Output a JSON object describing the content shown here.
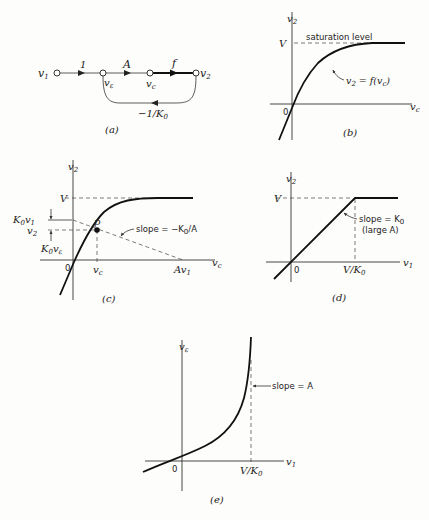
{
  "panels": {
    "a": {
      "caption": "(a)",
      "nodes": [
        {
          "name": "v",
          "sub": "1"
        },
        {
          "name": "v",
          "sub": "ε"
        },
        {
          "name": "v",
          "sub": "c"
        },
        {
          "name": "v",
          "sub": "2"
        }
      ],
      "branches": [
        {
          "from": "v1",
          "to": "vε",
          "gain": "1"
        },
        {
          "from": "vε",
          "to": "vc",
          "gain": "A"
        },
        {
          "from": "vc",
          "to": "v2",
          "gain": "f"
        },
        {
          "from": "v2",
          "to": "vε",
          "gain_main": "−1/K",
          "gain_sub": "0"
        }
      ]
    },
    "b": {
      "caption": "(b)",
      "y_axis": {
        "name": "v",
        "sub": "2"
      },
      "x_axis": {
        "name": "v",
        "sub": "c"
      },
      "origin": "0",
      "level_label": "V",
      "saturation_label": "saturation level",
      "curve_label": "v₂ = f(v꜀)",
      "curve_label_parts": {
        "pre": "v",
        "sub1": "2",
        "mid": " = f(v",
        "sub2": "c",
        "post": ")"
      }
    },
    "c": {
      "caption": "(c)",
      "y_axis": {
        "name": "v",
        "sub": "2"
      },
      "x_axis": {
        "name": "v",
        "sub": "c"
      },
      "origin": "0",
      "level_label": "V",
      "point_label": "p",
      "k0v1_label": {
        "k": "K",
        "k_sub": "0",
        "v": "v",
        "v_sub": "1"
      },
      "v2_label": {
        "name": "v",
        "sub": "2"
      },
      "k0ve_label": {
        "k": "K",
        "k_sub": "0",
        "v": "v",
        "v_sub": "ε"
      },
      "vc_tick": {
        "name": "v",
        "sub": "c"
      },
      "av1_tick": {
        "a": "A",
        "v": "v",
        "sub": "1"
      },
      "slope_label": {
        "pre": "slope = −K",
        "sub": "0",
        "post": "/A"
      }
    },
    "d": {
      "caption": "(d)",
      "y_axis": {
        "name": "v",
        "sub": "2"
      },
      "x_axis": {
        "name": "v",
        "sub": "1"
      },
      "origin": "0",
      "level_label": "V",
      "knee_tick": {
        "pre": "V/K",
        "sub": "0"
      },
      "slope_label": {
        "pre": "slope = K",
        "sub": "0"
      },
      "slope_note": "(large A)"
    },
    "e": {
      "caption": "(e)",
      "y_axis": {
        "name": "v",
        "sub": "ε"
      },
      "x_axis": {
        "name": "v",
        "sub": "1"
      },
      "origin": "0",
      "asymptote_tick": {
        "pre": "V/K",
        "sub": "0"
      },
      "slope_label": "slope = A"
    }
  }
}
